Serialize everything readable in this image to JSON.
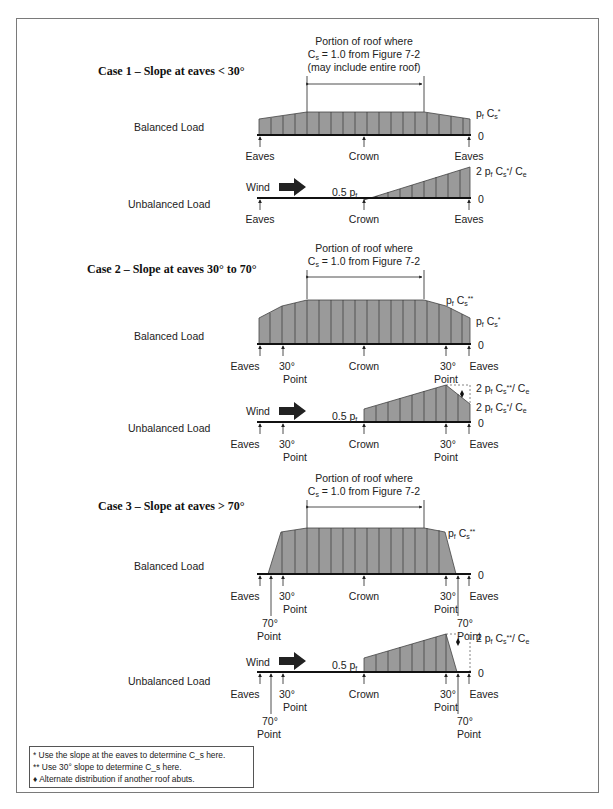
{
  "cases": [
    {
      "title": "Case 1 – Slope at eaves < 30°",
      "bracket_note": [
        "Portion of roof where",
        "C_s = 1.0 from Figure 7-2",
        "(may include entire roof)"
      ],
      "balanced": {
        "label": "Balanced Load",
        "top_label": "p_f C_s*",
        "zero_label": "0",
        "supports": [
          "Eaves",
          "Crown",
          "Eaves"
        ]
      },
      "unbalanced": {
        "label": "Unbalanced Load",
        "wind_label": "Wind",
        "crown_label": "0.5 p_f",
        "top_label": "2 p_f C_s*/ C_e",
        "zero_label": "0",
        "supports": [
          "Eaves",
          "Crown",
          "Eaves"
        ]
      }
    },
    {
      "title": "Case 2 – Slope at eaves 30° to 70°",
      "bracket_note": [
        "Portion of roof where",
        "C_s = 1.0 from Figure 7-2"
      ],
      "balanced": {
        "label": "Balanced Load",
        "top_label": "p_f C_s**",
        "mid_label": "p_f C_s*",
        "zero_label": "0",
        "supports": [
          "Eaves",
          "30° Point",
          "Crown",
          "30° Point",
          "Eaves"
        ]
      },
      "unbalanced": {
        "label": "Unbalanced Load",
        "wind_label": "Wind",
        "crown_label": "0.5 p_f",
        "top_label": "2 p_f C_s**/ C_e",
        "mid_label": "2 p_f C_s*/ C_e",
        "zero_label": "0",
        "supports": [
          "Eaves",
          "30° Point",
          "Crown",
          "30° Point",
          "Eaves"
        ]
      }
    },
    {
      "title": "Case 3 – Slope at eaves > 70°",
      "bracket_note": [
        "Portion of roof where",
        "C_s = 1.0 from Figure 7-2"
      ],
      "balanced": {
        "label": "Balanced Load",
        "top_label": "p_f C_s**",
        "zero_label": "0",
        "supports": [
          "Eaves",
          "70° Point",
          "30° Point",
          "Crown",
          "30° Point",
          "70° Point",
          "Eaves"
        ]
      },
      "unbalanced": {
        "label": "Unbalanced Load",
        "wind_label": "Wind",
        "crown_label": "0.5 p_f",
        "top_label": "2 p_f C_s**/ C_e",
        "zero_label": "0",
        "supports": [
          "Eaves",
          "70° Point",
          "30° Point",
          "Crown",
          "30° Point",
          "70° Point",
          "Eaves"
        ]
      }
    }
  ],
  "legend": [
    "* Use the slope at the eaves to determine C_s here.",
    "** Use 30° slope to determine C_s here.",
    "♦ Alternate distribution if another roof abuts."
  ],
  "colors": {
    "load_fill": "#9a9a9a",
    "beam": "#111111",
    "frame": "#7a7a7a"
  }
}
